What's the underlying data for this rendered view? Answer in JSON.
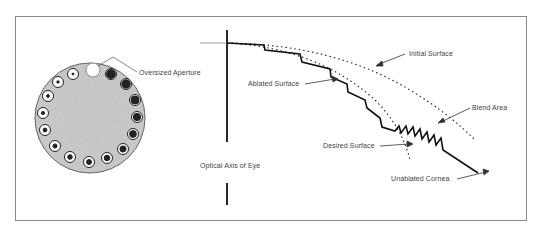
{
  "figure": {
    "left_panel": {
      "disc_label": "Oversized Aperture",
      "aperture_count": 17
    },
    "right_panel": {
      "labels": {
        "initial_surface": "Initial Surface",
        "ablated_surface": "Ablated Surface",
        "blend_area": "Blend Area",
        "desired_surface": "Desired Surface",
        "optical_axis": "Optical Axis of Eye",
        "unablated_cornea": "Unablated Cornea"
      }
    },
    "colors": {
      "line": "#111111",
      "frame": "#8a8a8a",
      "disc_fill": "#c9c9c9",
      "text": "#444444"
    }
  }
}
